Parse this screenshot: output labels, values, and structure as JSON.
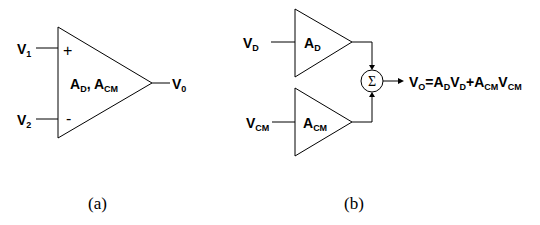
{
  "diagram_a": {
    "caption": "(a)",
    "inputs": [
      {
        "name": "V",
        "sub": "1",
        "polarity": "+"
      },
      {
        "name": "V",
        "sub": "2",
        "polarity": "-"
      }
    ],
    "gain_label": {
      "a1": "A",
      "s1": "D",
      "sep": ", ",
      "a2": "A",
      "s2": "CM"
    },
    "output": {
      "name": "V",
      "sub": "0"
    }
  },
  "diagram_b": {
    "caption": "(b)",
    "amp_d": {
      "input": {
        "name": "V",
        "sub": "D"
      },
      "gain": {
        "name": "A",
        "sub": "D"
      }
    },
    "amp_cm": {
      "input": {
        "name": "V",
        "sub": "CM"
      },
      "gain": {
        "name": "A",
        "sub": "CM"
      }
    },
    "summer_symbol": "Σ",
    "output_equation": {
      "t1": "V",
      "s1": "O",
      "t2": "=A",
      "s2": "D",
      "t3": "V",
      "s3": "D",
      "t4": "+A",
      "s4": "CM",
      "t5": "V",
      "s5": "CM"
    }
  }
}
